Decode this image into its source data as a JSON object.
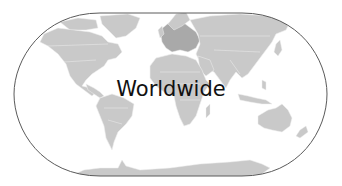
{
  "map": {
    "label": "Worldwide",
    "projection": "robinson",
    "colors": {
      "background": "#ffffff",
      "outline": "#5a5a5a",
      "land": "#c9c9c9",
      "land_highlight": "#a9a9a9",
      "borders": "#eeeeee",
      "label": "#111111"
    },
    "regions": [
      "North America",
      "Greenland",
      "South America",
      "Europe",
      "Africa",
      "Asia",
      "Australia",
      "New Zealand",
      "Antarctica"
    ]
  }
}
